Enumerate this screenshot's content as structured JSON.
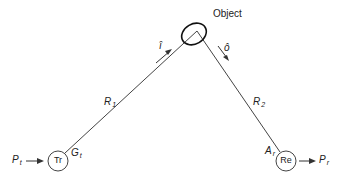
{
  "diagram": {
    "object_label": "Object",
    "incident_vector": "î",
    "outgoing_vector": "ô",
    "range_1": {
      "main": "R",
      "sub": "1"
    },
    "range_2": {
      "main": "R",
      "sub": "2"
    },
    "transmitter": {
      "label": "Tr",
      "gain": {
        "main": "G",
        "sub": "t"
      },
      "power": {
        "main": "P",
        "sub": "t"
      }
    },
    "receiver": {
      "label": "Re",
      "aperture": {
        "main": "A",
        "sub": "r"
      },
      "power": {
        "main": "P",
        "sub": "r"
      }
    },
    "colors": {
      "line": "#333333",
      "background": "#ffffff"
    }
  }
}
